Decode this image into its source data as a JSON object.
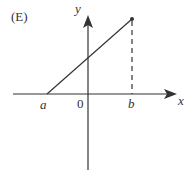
{
  "figure": {
    "panel_label": "(E)",
    "axes": {
      "x_label": "x",
      "y_label": "y"
    },
    "tick_labels": {
      "a": "a",
      "origin": "0",
      "b": "b"
    },
    "colors": {
      "stroke": "#333333",
      "background": "#ffffff"
    }
  }
}
